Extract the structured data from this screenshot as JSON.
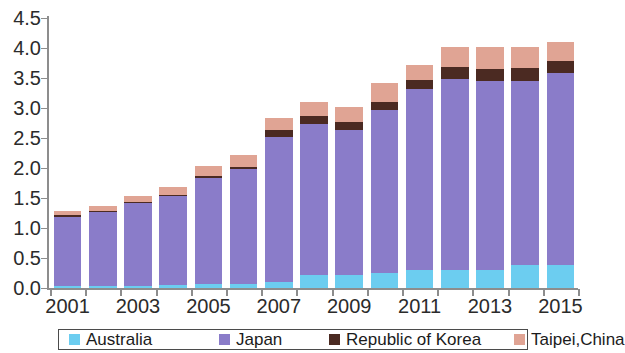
{
  "chart_data": {
    "type": "bar",
    "stacked": true,
    "title": "",
    "subtitle": "",
    "xlabel": "",
    "ylabel": "",
    "grid": false,
    "legend_position": "bottom",
    "categories": [
      "2001",
      "2002",
      "2003",
      "2004",
      "2005",
      "2006",
      "2007",
      "2008",
      "2009",
      "2010",
      "2011",
      "2012",
      "2013",
      "2014",
      "2015"
    ],
    "tick_labels_shown": [
      "2001",
      "2003",
      "2005",
      "2007",
      "2009",
      "2011",
      "2013",
      "2015"
    ],
    "ylim": [
      0.0,
      4.5
    ],
    "yticks": [
      "0.0",
      "0.5",
      "1.0",
      "1.5",
      "2.0",
      "2.5",
      "3.0",
      "3.5",
      "4.0",
      "4.5"
    ],
    "ytick_values": [
      0.0,
      0.5,
      1.0,
      1.5,
      2.0,
      2.5,
      3.0,
      3.5,
      4.0,
      4.5
    ],
    "series": [
      {
        "name": "Australia",
        "color": "#6ccdf0",
        "values": [
          0.03,
          0.03,
          0.04,
          0.05,
          0.06,
          0.07,
          0.1,
          0.22,
          0.22,
          0.25,
          0.3,
          0.3,
          0.3,
          0.38,
          0.38
        ]
      },
      {
        "name": "Japan",
        "color": "#8a7cc9",
        "values": [
          1.16,
          1.23,
          1.38,
          1.48,
          1.78,
          1.92,
          2.42,
          2.52,
          2.42,
          2.72,
          3.02,
          3.18,
          3.15,
          3.07,
          3.2
        ]
      },
      {
        "name": "Republic of Korea",
        "color": "#4b2a22",
        "values": [
          0.02,
          0.02,
          0.02,
          0.02,
          0.03,
          0.03,
          0.11,
          0.12,
          0.12,
          0.13,
          0.15,
          0.2,
          0.2,
          0.22,
          0.2
        ]
      },
      {
        "name": "Taipei,China",
        "color": "#e0a494",
        "values": [
          0.07,
          0.08,
          0.1,
          0.13,
          0.16,
          0.2,
          0.2,
          0.24,
          0.26,
          0.32,
          0.24,
          0.33,
          0.37,
          0.35,
          0.32
        ]
      }
    ],
    "totals": [
      1.28,
      1.36,
      1.54,
      1.68,
      2.03,
      2.22,
      2.83,
      3.1,
      3.02,
      3.42,
      3.71,
      4.01,
      4.02,
      4.02,
      4.1
    ]
  },
  "legend": {
    "items": [
      {
        "label": "Australia",
        "color": "#6ccdf0"
      },
      {
        "label": "Japan",
        "color": "#8a7cc9"
      },
      {
        "label": "Republic of Korea",
        "color": "#4b2a22"
      },
      {
        "label": "Taipei,China",
        "color": "#e0a494"
      }
    ]
  }
}
